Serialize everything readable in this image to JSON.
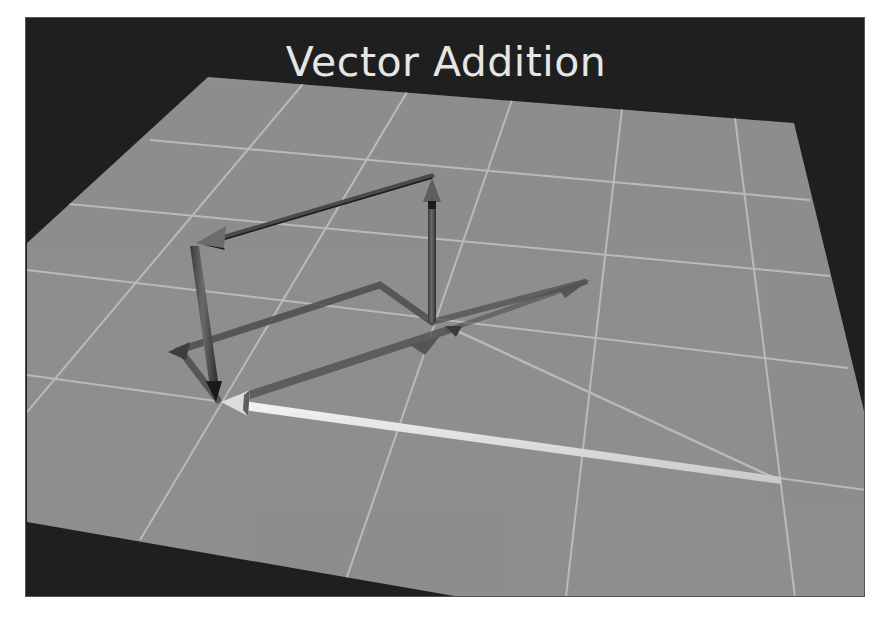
{
  "title": "Vector Addition",
  "colors": {
    "background": "#1f1f1f",
    "plane": "#8e8e8e",
    "grid": "#c4c4c4",
    "vector": "#5a5a5a",
    "vector_dark": "#2a2a2a",
    "resultant": "#e8e8e8",
    "shadow": "#4a4a4a",
    "title": "#e6e6e6"
  },
  "scene": {
    "plane": "grey ground plane with white grid lines, viewed in perspective",
    "vectors": [
      {
        "name": "vector-up",
        "description": "vertical arrow rising from the origin",
        "color": "dark grey"
      },
      {
        "name": "vector-left",
        "description": "arrow pointing left along the top",
        "color": "dark grey"
      },
      {
        "name": "vector-down",
        "description": "vertical arrow descending to the plane",
        "color": "dark grey"
      },
      {
        "name": "resultant-vector",
        "description": "white resultant arrow along the plane",
        "color": "white"
      },
      {
        "name": "thin-vector",
        "description": "thin arrow from resultant tail back to origin",
        "color": "light grey"
      }
    ]
  }
}
